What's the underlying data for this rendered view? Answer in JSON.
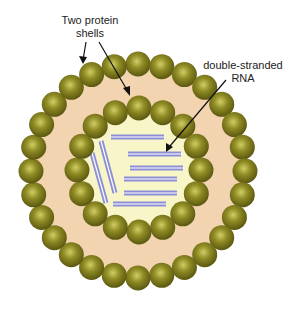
{
  "diagram": {
    "labels": {
      "shells": [
        "Two protein",
        "shells"
      ],
      "rna": [
        "double-stranded",
        "RNA"
      ]
    },
    "colors": {
      "ball": "#7d7a1c",
      "ball_highlight": "#c9c55a",
      "outer_fill": "#f3d4b0",
      "core_fill": "#f8f6c8",
      "rna_strand": "#8c8fd6",
      "rna_center": "#ffffff",
      "arrow": "#111111"
    },
    "outer_shell": {
      "cx": 138,
      "cy": 171,
      "r": 107,
      "ball_r": 12.5,
      "count": 28
    },
    "inner_shell": {
      "cx": 139,
      "cy": 170,
      "r": 62,
      "ball_r": 12.5,
      "count": 16
    },
    "rna_strands": [
      {
        "x1": 111,
        "y1": 137,
        "x2": 164,
        "y2": 137
      },
      {
        "x1": 128,
        "y1": 154,
        "x2": 181,
        "y2": 154
      },
      {
        "x1": 130,
        "y1": 168,
        "x2": 183,
        "y2": 168
      },
      {
        "x1": 124,
        "y1": 179,
        "x2": 177,
        "y2": 179
      },
      {
        "x1": 124,
        "y1": 193,
        "x2": 177,
        "y2": 193
      },
      {
        "x1": 113,
        "y1": 204,
        "x2": 166,
        "y2": 204
      },
      {
        "x1": 101,
        "y1": 141,
        "x2": 115,
        "y2": 193
      },
      {
        "x1": 92,
        "y1": 153,
        "x2": 106,
        "y2": 203
      }
    ]
  }
}
